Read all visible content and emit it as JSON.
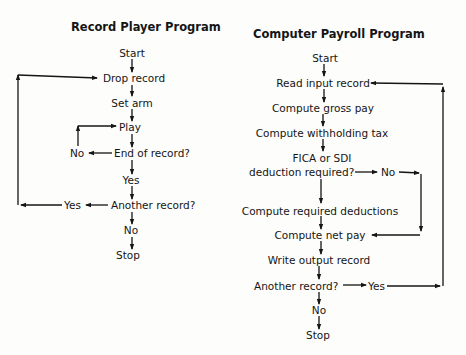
{
  "left_chart": {
    "title": "Record Player Program",
    "steps": {
      "start": "Start",
      "drop_record": "Drop record",
      "set_arm": "Set arm",
      "play": "Play",
      "end_of_record": "End of record?",
      "end_no": "No",
      "end_yes": "Yes",
      "another_record": "Another record?",
      "another_yes": "Yes",
      "another_no": "No",
      "stop": "Stop"
    }
  },
  "right_chart": {
    "title": "Computer Payroll Program",
    "steps": {
      "start": "Start",
      "read_input": "Read input record",
      "gross_pay": "Compute gross pay",
      "withholding": "Compute withholding tax",
      "fica_line1": "FICA or SDI",
      "fica_line2": "deduction required?",
      "fica_no": "No",
      "required_deductions": "Compute required deductions",
      "net_pay": "Compute net pay",
      "write_output": "Write output record",
      "another_record": "Another record?",
      "another_yes": "Yes",
      "another_no": "No",
      "stop": "Stop"
    }
  },
  "colors": {
    "ink": "#151515",
    "paper": "#fdfdfb"
  }
}
